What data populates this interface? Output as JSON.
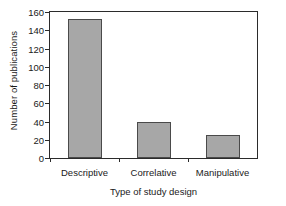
{
  "chart_data": {
    "type": "bar",
    "title": "",
    "categories": [
      "Descriptive",
      "Correlative",
      "Manipulative"
    ],
    "values": [
      152,
      39,
      25
    ],
    "series": [
      {
        "name": "Number of publications",
        "values": [
          152,
          39,
          25
        ]
      }
    ],
    "xlabel": "Type of study design",
    "ylabel": "Number of publications",
    "ylim": [
      0,
      160
    ],
    "yticks": [
      0,
      20,
      40,
      60,
      80,
      100,
      120,
      140,
      160
    ],
    "ytick_labels": [
      "0",
      "20",
      "40",
      "60",
      "80",
      "100",
      "120",
      "140",
      "160"
    ],
    "grid": false,
    "legend": false,
    "legend_position": "none",
    "bar_fill_color": "#a7a7a7",
    "bar_edge_color": "#4a4a4a",
    "axis_color": "#2b2b2b",
    "background_color": "#ffffff",
    "text_color": "#1a1a1a"
  }
}
